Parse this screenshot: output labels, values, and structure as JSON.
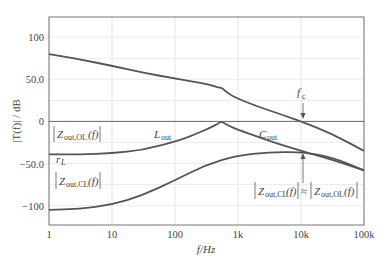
{
  "chart_data": {
    "type": "line",
    "title": "",
    "xlabel": "f/Hz",
    "ylabel": "|T(f)| / dB",
    "xscale": "log",
    "xlim": [
      1,
      100000
    ],
    "ylim": [
      -123,
      124
    ],
    "grid": true,
    "x_tick_labels": [
      "1",
      "10",
      "100",
      "1k",
      "10k",
      "100k"
    ],
    "x_ticks": [
      1,
      10,
      100,
      1000,
      10000,
      100000
    ],
    "y_tick_labels": [
      "100",
      "50.0",
      "0",
      "-50.0",
      "-100"
    ],
    "y_ticks": [
      100,
      50,
      0,
      -50,
      -100
    ],
    "series": [
      {
        "name": "|T(f)|",
        "x": [
          1,
          3,
          10,
          30,
          100,
          200,
          350,
          500,
          550,
          700,
          1000,
          2000,
          5000,
          10000,
          30000,
          100000
        ],
        "values": [
          80,
          74,
          66,
          58,
          51,
          47,
          44,
          40,
          40,
          33,
          27,
          18,
          8,
          0,
          -14,
          -35
        ]
      },
      {
        "name": "|Zout,OL(f)|",
        "x": [
          1,
          3,
          10,
          30,
          100,
          200,
          350,
          500,
          550,
          700,
          1000,
          2000,
          5000,
          10000,
          30000,
          100000
        ],
        "values": [
          -39,
          -39,
          -38,
          -34,
          -24,
          -16,
          -8,
          -2,
          0,
          -5,
          -10,
          -18,
          -28,
          -35,
          -45,
          -58
        ]
      },
      {
        "name": "|Zout,CL(f)|",
        "x": [
          1,
          3,
          10,
          30,
          100,
          300,
          1000,
          3000,
          10000,
          30000,
          100000
        ],
        "values": [
          -105,
          -104,
          -99,
          -88,
          -70,
          -52,
          -40,
          -37,
          -36,
          -42,
          -58
        ]
      },
      {
        "name": "0 dB reference",
        "x": [
          1,
          100000
        ],
        "values": [
          0,
          0
        ]
      }
    ],
    "annotations": [
      {
        "text": "f_c",
        "at": [
          10000,
          0
        ],
        "note": "crossover frequency arrow"
      },
      {
        "text": "|Z_out,OL(f)|",
        "at": [
          1.5,
          -28
        ]
      },
      {
        "text": "r_L",
        "at": [
          1.2,
          -48
        ]
      },
      {
        "text": "L_out",
        "at": [
          60,
          -33
        ]
      },
      {
        "text": "C_out",
        "at": [
          3000,
          -17
        ]
      },
      {
        "text": "|Z_out,CL(f)|",
        "at": [
          1.5,
          -85
        ]
      },
      {
        "text": "|Z_out,CL(f)| ≈ |Z_out,OL(f)|",
        "at": [
          1500,
          -70
        ],
        "note": "arrow pointing at 10k"
      }
    ]
  },
  "labels": {
    "y_axis": "|T(f)| / dB",
    "x_axis": "f/Hz",
    "fc_main": "f",
    "fc_sub": "c",
    "zol_main": "Z",
    "zol_sub": "out,OL",
    "zol_tail": "(f)",
    "rl_main": "r",
    "rl_sub": "L",
    "lout_main": "L",
    "lout_sub": "out",
    "cout_main": "C",
    "cout_sub": "out",
    "zcl_main": "Z",
    "zcl_sub": "out,CL",
    "zcl_tail": "(f)",
    "approx": "≈"
  }
}
